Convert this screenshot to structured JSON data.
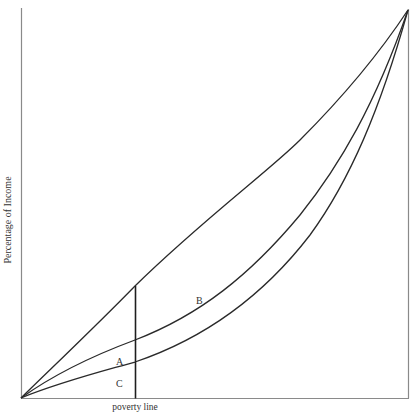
{
  "diagram": {
    "type": "lorenz-curve-poverty",
    "y_axis_label": "Percentage of Income",
    "x_axis_label": "",
    "poverty_line_label": "poverty line",
    "region_labels": {
      "A": "A",
      "B": "B",
      "C": "C"
    },
    "curves": [
      {
        "name": "equality-line",
        "description": "upper, nearly straight diagonal"
      },
      {
        "name": "lorenz-curve-middle",
        "description": "middle convex curve"
      },
      {
        "name": "lorenz-curve-lower",
        "description": "lower convex curve"
      }
    ],
    "colors": {
      "line": "#2a2a2a",
      "axis": "#8a8a8a",
      "text": "#333333",
      "background": "#ffffff"
    }
  }
}
